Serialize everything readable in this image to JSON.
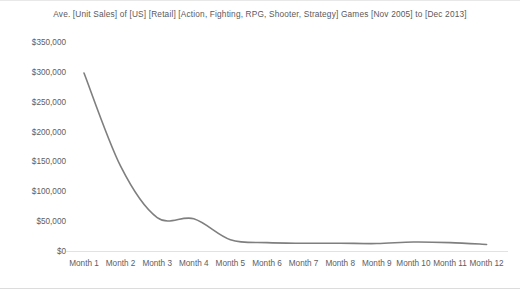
{
  "chart_data": {
    "type": "line",
    "title": "Ave. [Unit Sales] of [US] [Retail] [Action, Fighting, RPG, Shooter, Strategy] Games [Nov 2005] to [Dec 2013]",
    "subtitle": "",
    "xlabel": "",
    "ylabel": "",
    "categories": [
      "Month 1",
      "Month 2",
      "Month 3",
      "Month 4",
      "Month 5",
      "Month 6",
      "Month 7",
      "Month 8",
      "Month 9",
      "Month 10",
      "Month 11",
      "Month 12"
    ],
    "values": [
      298000,
      142000,
      56000,
      54000,
      19000,
      14000,
      13000,
      13000,
      12500,
      15000,
      14000,
      11000
    ],
    "series": [
      {
        "name": "Ave. Unit Sales",
        "values": [
          298000,
          142000,
          56000,
          54000,
          19000,
          14000,
          13000,
          13000,
          12500,
          15000,
          14000,
          11000
        ],
        "color": "#7f7f7f"
      }
    ],
    "ylim": [
      0,
      350000
    ],
    "y_ticks": [
      0,
      50000,
      100000,
      150000,
      200000,
      250000,
      300000,
      350000
    ],
    "y_tick_labels": [
      "$0",
      "$50,000",
      "$100,000",
      "$150,000",
      "$200,000",
      "$250,000",
      "$300,000",
      "$350,000"
    ],
    "x_tick_labels": [
      "Month 1",
      "Month 2",
      "Month 3",
      "Month 4",
      "Month 5",
      "Month 6",
      "Month 7",
      "Month 8",
      "Month 9",
      "Month 10",
      "Month 11",
      "Month 12"
    ],
    "grid": false,
    "legend": false,
    "legend_position": "none",
    "smoothing": "spline",
    "line_color": "#7f7f7f",
    "axis_color": "#e2e2e2",
    "text_color": "#5d5d5f",
    "background_color": "#ffffff"
  }
}
